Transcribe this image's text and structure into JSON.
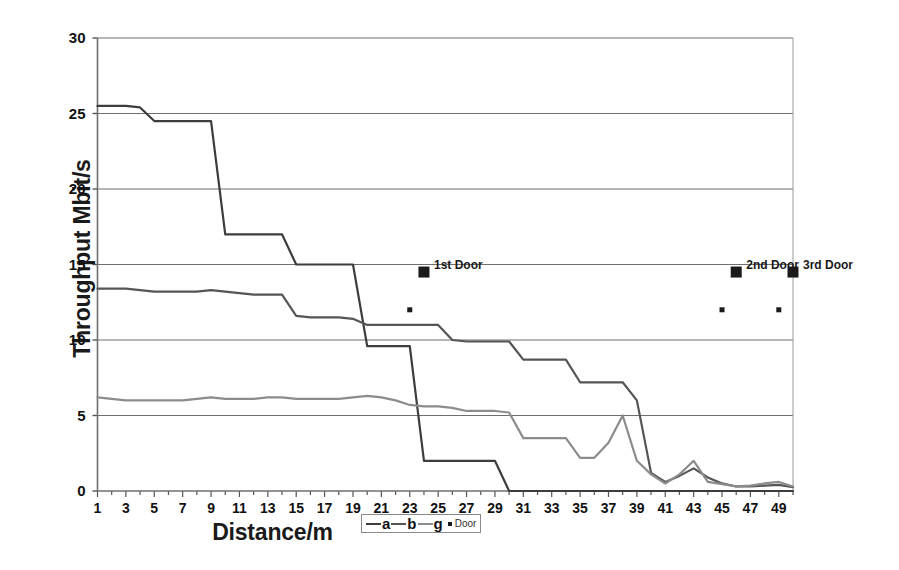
{
  "chart_data": {
    "type": "line",
    "title": "",
    "xlabel": "Distance/m",
    "ylabel": "Throughput Mbit/s",
    "xlim": [
      1,
      50
    ],
    "ylim": [
      0,
      30
    ],
    "yticks": [
      0,
      5,
      10,
      15,
      20,
      25,
      30
    ],
    "xticks": [
      1,
      3,
      5,
      7,
      9,
      11,
      13,
      15,
      17,
      19,
      21,
      23,
      25,
      27,
      29,
      31,
      33,
      35,
      37,
      39,
      41,
      43,
      45,
      47,
      49
    ],
    "grid": "horizontal",
    "legend_position": "bottom-center",
    "x": [
      1,
      2,
      3,
      4,
      5,
      6,
      7,
      8,
      9,
      10,
      11,
      12,
      13,
      14,
      15,
      16,
      17,
      18,
      19,
      20,
      21,
      22,
      23,
      24,
      25,
      26,
      27,
      28,
      29,
      30,
      31,
      32,
      33,
      34,
      35,
      36,
      37,
      38,
      39,
      40,
      41,
      42,
      43,
      44,
      45,
      46,
      47,
      48,
      49,
      50
    ],
    "series": [
      {
        "name": "a",
        "color": "#3d3d3d",
        "values": [
          25.5,
          25.5,
          25.5,
          25.4,
          24.5,
          24.5,
          24.5,
          24.5,
          24.5,
          17.0,
          17.0,
          17.0,
          17.0,
          17.0,
          15.0,
          15.0,
          15.0,
          15.0,
          15.0,
          9.6,
          9.6,
          9.6,
          9.6,
          2.0,
          2.0,
          2.0,
          2.0,
          2.0,
          2.0,
          0.0,
          0.0,
          0.0,
          0.0,
          0.0,
          0.0,
          0.0,
          0.0,
          0.0,
          0.0,
          0.0,
          0.0,
          0.0,
          0.0,
          0.0,
          0.0,
          0.0,
          0.0,
          0.0,
          0.0,
          0.0
        ]
      },
      {
        "name": "b",
        "color": "#555555",
        "values": [
          13.4,
          13.4,
          13.4,
          13.3,
          13.2,
          13.2,
          13.2,
          13.2,
          13.3,
          13.2,
          13.1,
          13.0,
          13.0,
          13.0,
          11.6,
          11.5,
          11.5,
          11.5,
          11.4,
          11.0,
          11.0,
          11.0,
          11.0,
          11.0,
          11.0,
          10.0,
          9.9,
          9.9,
          9.9,
          9.9,
          8.7,
          8.7,
          8.7,
          8.7,
          7.2,
          7.2,
          7.2,
          7.2,
          6.0,
          1.2,
          0.6,
          1.0,
          1.5,
          0.9,
          0.5,
          0.3,
          0.3,
          0.35,
          0.4,
          0.25
        ]
      },
      {
        "name": "g",
        "color": "#8c8c8c",
        "values": [
          6.2,
          6.1,
          6.0,
          6.0,
          6.0,
          6.0,
          6.0,
          6.1,
          6.2,
          6.1,
          6.1,
          6.1,
          6.2,
          6.2,
          6.1,
          6.1,
          6.1,
          6.1,
          6.2,
          6.3,
          6.2,
          6.0,
          5.7,
          5.6,
          5.6,
          5.5,
          5.3,
          5.3,
          5.3,
          5.2,
          3.5,
          3.5,
          3.5,
          3.5,
          2.2,
          2.2,
          3.2,
          5.0,
          2.0,
          1.1,
          0.5,
          1.1,
          2.0,
          0.6,
          0.45,
          0.3,
          0.35,
          0.5,
          0.6,
          0.3
        ]
      }
    ],
    "markers": {
      "name": "Door",
      "color": "#1a1a1a",
      "large": [
        {
          "x": 24,
          "y": 14.5,
          "label": "1st Door"
        },
        {
          "x": 46,
          "y": 14.5,
          "label": "2nd Door"
        },
        {
          "x": 50,
          "y": 14.5,
          "label": "3rd Door"
        }
      ],
      "small": [
        {
          "x": 23,
          "y": 12.0
        },
        {
          "x": 45,
          "y": 12.0
        },
        {
          "x": 49,
          "y": 12.0
        }
      ]
    },
    "legend": [
      {
        "label": "a",
        "type": "line",
        "color": "#3d3d3d"
      },
      {
        "label": "b",
        "type": "line",
        "color": "#555555"
      },
      {
        "label": "g",
        "type": "line",
        "color": "#8c8c8c"
      },
      {
        "label": "Door",
        "type": "marker",
        "color": "#1a1a1a"
      }
    ]
  }
}
